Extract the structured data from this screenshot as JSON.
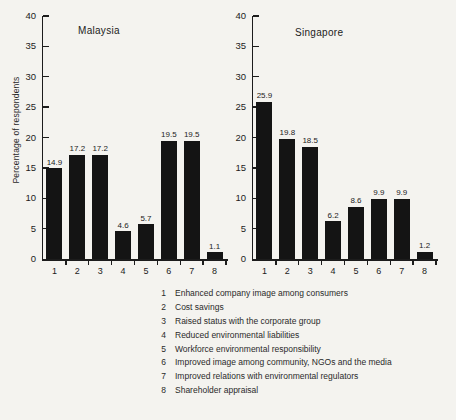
{
  "figure": {
    "background": "#f4f3ef",
    "ink_color": "#1c1c1c",
    "bar_color": "#141414"
  },
  "chart_data": [
    {
      "type": "bar",
      "title": "Malaysia",
      "ylabel": "Percentage of respondents",
      "xlabel": "",
      "categories": [
        "1",
        "2",
        "3",
        "4",
        "5",
        "6",
        "7",
        "8"
      ],
      "values": [
        14.9,
        17.2,
        17.2,
        4.6,
        5.7,
        19.5,
        19.5,
        1.1
      ],
      "ylim": [
        0,
        40
      ],
      "ytick_step": 5,
      "grid": false,
      "value_labels": true,
      "legend_position": "none"
    },
    {
      "type": "bar",
      "title": "Singapore",
      "ylabel": "",
      "xlabel": "",
      "categories": [
        "1",
        "2",
        "3",
        "4",
        "5",
        "6",
        "7",
        "8"
      ],
      "values": [
        25.9,
        19.8,
        18.5,
        6.2,
        8.6,
        9.9,
        9.9,
        1.2
      ],
      "ylim": [
        0,
        40
      ],
      "ytick_step": 5,
      "grid": false,
      "value_labels": true,
      "legend_position": "none"
    }
  ],
  "legend": {
    "items": [
      {
        "num": "1",
        "label": "Enhanced company image among consumers"
      },
      {
        "num": "2",
        "label": "Cost savings"
      },
      {
        "num": "3",
        "label": "Raised status with the corporate group"
      },
      {
        "num": "4",
        "label": "Reduced environmental liabilities"
      },
      {
        "num": "5",
        "label": "Workforce environmental responsibility"
      },
      {
        "num": "6",
        "label": "Improved image among community, NGOs and the media"
      },
      {
        "num": "7",
        "label": "Improved relations with environmental regulators"
      },
      {
        "num": "8",
        "label": "Shareholder appraisal"
      }
    ]
  }
}
